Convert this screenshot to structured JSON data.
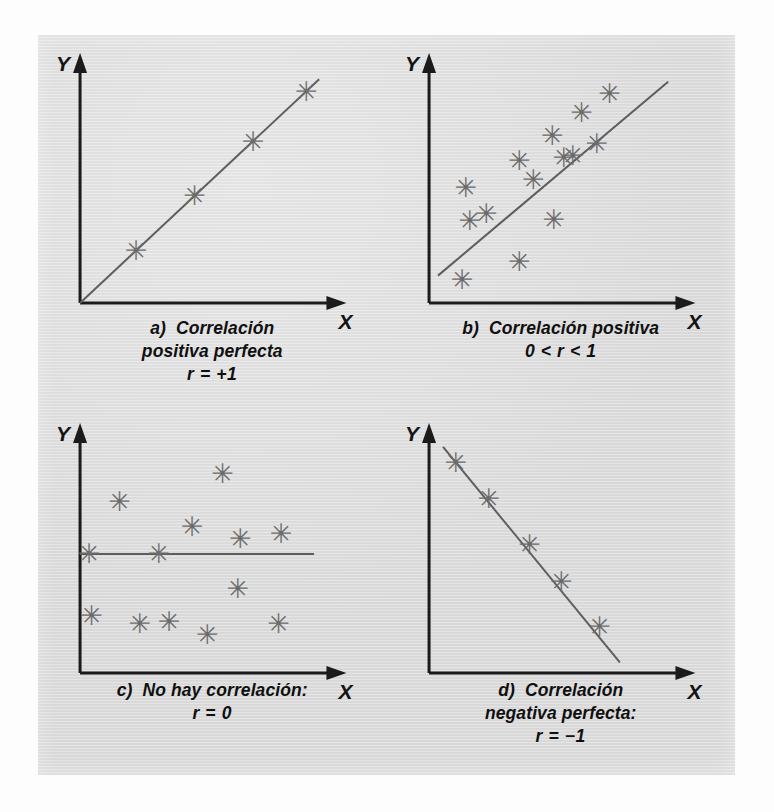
{
  "figure": {
    "plate_color": "#dcdcdc",
    "page_color": "#fdfdfd",
    "axis_color": "#1b1b1b",
    "marker_color": "#6b6b6b",
    "line_color": "#5e5e5e",
    "marker_glyph": "✳",
    "axis_label_x": "X",
    "axis_label_y": "Y"
  },
  "chart_data": [
    {
      "id": "panel-a",
      "type": "scatter",
      "title": "a) Correlación positiva perfecta",
      "xlabel": "X",
      "ylabel": "Y",
      "grid": false,
      "legend": "none",
      "xlim": [
        0,
        10
      ],
      "ylim": [
        0,
        10
      ],
      "annotation": "r = +1",
      "caption_lines": [
        "a)  Correlación",
        "positiva perfecta",
        "r = +1"
      ],
      "trend": {
        "x1": 0.0,
        "y1": 0.0,
        "x2": 9.4,
        "y2": 9.4
      },
      "points": [
        {
          "x": 2.2,
          "y": 2.2
        },
        {
          "x": 4.5,
          "y": 4.5
        },
        {
          "x": 6.8,
          "y": 6.8
        },
        {
          "x": 8.9,
          "y": 8.9
        }
      ]
    },
    {
      "id": "panel-b",
      "type": "scatter",
      "title": "b) Correlación positiva",
      "xlabel": "X",
      "ylabel": "Y",
      "grid": false,
      "legend": "none",
      "xlim": [
        0,
        10
      ],
      "ylim": [
        0,
        10
      ],
      "annotation": "0 < r < 1",
      "caption_lines": [
        "b)  Correlación positiva",
        "0 < r < 1"
      ],
      "trend": {
        "x1": 0.35,
        "y1": 1.15,
        "x2": 9.4,
        "y2": 9.3
      },
      "points": [
        {
          "x": 1.45,
          "y": 4.85
        },
        {
          "x": 1.6,
          "y": 3.45
        },
        {
          "x": 2.25,
          "y": 3.75
        },
        {
          "x": 1.3,
          "y": 1.0
        },
        {
          "x": 3.55,
          "y": 1.75
        },
        {
          "x": 3.55,
          "y": 6.0
        },
        {
          "x": 4.1,
          "y": 5.2
        },
        {
          "x": 4.85,
          "y": 7.05
        },
        {
          "x": 4.9,
          "y": 3.5
        },
        {
          "x": 5.3,
          "y": 6.1
        },
        {
          "x": 5.65,
          "y": 6.2
        },
        {
          "x": 6.0,
          "y": 8.0
        },
        {
          "x": 6.6,
          "y": 6.7
        },
        {
          "x": 7.1,
          "y": 8.8
        }
      ]
    },
    {
      "id": "panel-c",
      "type": "scatter",
      "title": "c) No hay correlación",
      "xlabel": "X",
      "ylabel": "Y",
      "grid": false,
      "legend": "none",
      "xlim": [
        0,
        10
      ],
      "ylim": [
        0,
        10
      ],
      "annotation": "r = 0",
      "caption_lines": [
        "c)  No hay correlación:",
        "r = 0"
      ],
      "trend": {
        "x1": 0.0,
        "y1": 5.0,
        "x2": 9.2,
        "y2": 5.0
      },
      "points": [
        {
          "x": 0.35,
          "y": 5.0
        },
        {
          "x": 1.55,
          "y": 7.2
        },
        {
          "x": 3.1,
          "y": 5.0
        },
        {
          "x": 4.4,
          "y": 6.15
        },
        {
          "x": 5.6,
          "y": 8.4
        },
        {
          "x": 6.3,
          "y": 5.65
        },
        {
          "x": 6.2,
          "y": 3.55
        },
        {
          "x": 7.9,
          "y": 5.85
        },
        {
          "x": 0.45,
          "y": 2.4
        },
        {
          "x": 2.35,
          "y": 2.1
        },
        {
          "x": 3.5,
          "y": 2.15
        },
        {
          "x": 5.0,
          "y": 1.6
        },
        {
          "x": 7.8,
          "y": 2.1
        }
      ]
    },
    {
      "id": "panel-d",
      "type": "scatter",
      "title": "d) Correlación negativa perfecta",
      "xlabel": "X",
      "ylabel": "Y",
      "grid": false,
      "legend": "none",
      "xlim": [
        0,
        10
      ],
      "ylim": [
        0,
        10
      ],
      "annotation": "r = −1",
      "caption_lines": [
        "d)  Correlación",
        "negativa perfecta:",
        "r = −1"
      ],
      "trend": {
        "x1": 0.55,
        "y1": 9.5,
        "x2": 7.5,
        "y2": 0.45
      },
      "points": [
        {
          "x": 1.05,
          "y": 8.85
        },
        {
          "x": 2.35,
          "y": 7.35
        },
        {
          "x": 3.95,
          "y": 5.4
        },
        {
          "x": 5.2,
          "y": 3.85
        },
        {
          "x": 6.7,
          "y": 1.95
        }
      ]
    }
  ]
}
